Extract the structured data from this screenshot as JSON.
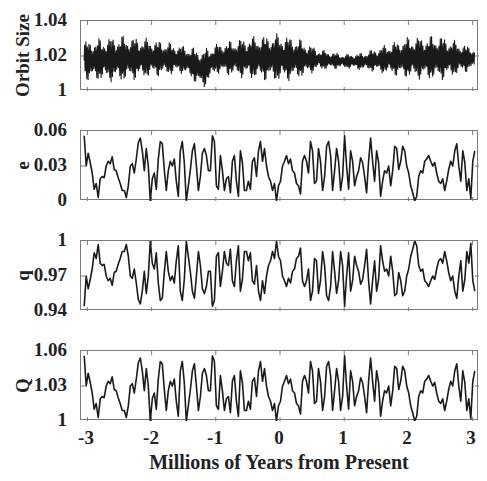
{
  "figure": {
    "xlabel": "Millions of Years from Present",
    "xticks": [
      "-3",
      "-2",
      "-1",
      "0",
      "1",
      "2",
      "3"
    ]
  },
  "panels": [
    {
      "ylabel": "Orbit Size",
      "yticks": [
        "1.04",
        "1.02",
        "1"
      ]
    },
    {
      "ylabel": "e",
      "yticks": [
        "0.06",
        "0.03",
        "0"
      ]
    },
    {
      "ylabel": "q",
      "yticks": [
        "1",
        "0.97",
        "0.94"
      ]
    },
    {
      "ylabel": "Q",
      "yticks": [
        "1.06",
        "1.03",
        "1"
      ]
    }
  ],
  "colors": {
    "line": "#1a1a1a",
    "axis": "#7a7a7a",
    "text": "#222222"
  },
  "chart_data": [
    {
      "type": "line",
      "title": "",
      "xlabel": "",
      "ylabel": "Orbit Size",
      "xlim": [
        -3.05,
        3.05
      ],
      "ylim": [
        1.0,
        1.04
      ],
      "yticks": [
        1.0,
        1.02,
        1.04
      ],
      "grid": false,
      "description": "Rapid oscillation about ~1.018 with slowly varying amplitude envelope",
      "envelope": {
        "x": [
          -3.0,
          -2.5,
          -2.0,
          -1.5,
          -1.2,
          -1.0,
          -0.5,
          0.0,
          0.3,
          0.6,
          1.0,
          1.3,
          1.6,
          2.0,
          2.5,
          3.0
        ],
        "upper": [
          1.029,
          1.032,
          1.03,
          1.026,
          1.024,
          1.027,
          1.031,
          1.033,
          1.03,
          1.024,
          1.021,
          1.022,
          1.026,
          1.031,
          1.032,
          1.025
        ],
        "lower": [
          1.006,
          1.005,
          1.008,
          1.01,
          1.001,
          1.01,
          1.007,
          1.005,
          1.007,
          1.012,
          1.013,
          1.012,
          1.01,
          1.007,
          1.006,
          1.012
        ]
      }
    },
    {
      "type": "line",
      "ylabel": "e",
      "xlim": [
        -3.05,
        3.05
      ],
      "ylim": [
        0,
        0.06
      ],
      "yticks": [
        0,
        0.03,
        0.06
      ],
      "x_start": -3.05,
      "x_step": 0.0312,
      "values": [
        0.056,
        0.03,
        0.041,
        0.033,
        0.024,
        0.01,
        0.015,
        0.003,
        0.019,
        0.021,
        0.02,
        0.03,
        0.034,
        0.032,
        0.038,
        0.027,
        0.026,
        0.02,
        0.015,
        0.009,
        0.009,
        0.003,
        0.013,
        0.03,
        0.032,
        0.024,
        0.036,
        0.05,
        0.054,
        0.043,
        0.026,
        0.045,
        0.03,
        0.0,
        0.019,
        0.024,
        0.01,
        0.036,
        0.051,
        0.049,
        0.027,
        0.009,
        0.026,
        0.034,
        0.03,
        0.036,
        0.017,
        0.004,
        0.043,
        0.051,
        0.033,
        0.0,
        0.013,
        0.027,
        0.043,
        0.049,
        0.03,
        0.009,
        0.021,
        0.041,
        0.045,
        0.039,
        0.026,
        0.026,
        0.056,
        0.051,
        0.013,
        0.01,
        0.039,
        0.026,
        0.009,
        0.019,
        0.021,
        0.007,
        0.034,
        0.039,
        0.017,
        0.004,
        0.043,
        0.033,
        0.009,
        0.009,
        0.017,
        0.01,
        0.034,
        0.037,
        0.021,
        0.043,
        0.051,
        0.034,
        0.045,
        0.03,
        0.021,
        0.017,
        0.009,
        0.015,
        0.0,
        0.013,
        0.017,
        0.03,
        0.034,
        0.039,
        0.032,
        0.036,
        0.026,
        0.024,
        0.015,
        0.013,
        0.006,
        0.034,
        0.039,
        0.034,
        0.024,
        0.051,
        0.043,
        0.015,
        0.017,
        0.045,
        0.034,
        0.009,
        0.021,
        0.047,
        0.051,
        0.039,
        0.009,
        0.026,
        0.045,
        0.034,
        0.009,
        0.021,
        0.056,
        0.03,
        0.01,
        0.043,
        0.034,
        0.013,
        0.021,
        0.026,
        0.037,
        0.033,
        0.021,
        0.007,
        0.034,
        0.054,
        0.034,
        0.017,
        0.043,
        0.033,
        0.004,
        0.017,
        0.026,
        0.024,
        0.03,
        0.013,
        0.026,
        0.047,
        0.045,
        0.027,
        0.034,
        0.047,
        0.043,
        0.03,
        0.024,
        0.013,
        0.007,
        0.0,
        0.004,
        0.021,
        0.026,
        0.024,
        0.034,
        0.036,
        0.039,
        0.034,
        0.03,
        0.033,
        0.024,
        0.017,
        0.015,
        0.019,
        0.009,
        0.017,
        0.027,
        0.034,
        0.03,
        0.043,
        0.049,
        0.03,
        0.017,
        0.043,
        0.033,
        0.009,
        0.019,
        0.002,
        0.034,
        0.043
      ]
    },
    {
      "type": "line",
      "ylabel": "q",
      "xlim": [
        -3.05,
        3.05
      ],
      "ylim": [
        0.94,
        1.0
      ],
      "yticks": [
        0.94,
        0.97,
        1.0
      ],
      "relation": "q = 1 - e (perihelion distance, mirrors e)"
    },
    {
      "type": "line",
      "ylabel": "Q",
      "xlim": [
        -3.05,
        3.05
      ],
      "ylim": [
        1.0,
        1.06
      ],
      "yticks": [
        1.0,
        1.03,
        1.06
      ],
      "relation": "Q = 1 + e (aphelion distance, follows e)"
    }
  ]
}
